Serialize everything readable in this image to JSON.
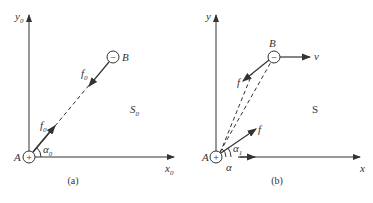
{
  "panels": [
    {
      "id": "a",
      "caption": "(a)",
      "frame_label": "S",
      "frame_sub": "0",
      "x_axis": {
        "label": "x",
        "sub": "0"
      },
      "y_axis": {
        "label": "y",
        "sub": "0"
      },
      "charge_A": {
        "label": "A",
        "sign": "+"
      },
      "charge_B": {
        "label": "B",
        "sign": "−"
      },
      "force_on_A": {
        "label": "f",
        "sub": "0"
      },
      "force_on_B": {
        "label": "f",
        "sub": "0"
      },
      "angle": {
        "label": "α",
        "sub": "0"
      }
    },
    {
      "id": "b",
      "caption": "(b)",
      "frame_label": "S",
      "x_axis": {
        "label": "x"
      },
      "y_axis": {
        "label": "y"
      },
      "charge_A": {
        "label": "A",
        "sign": "+"
      },
      "charge_B": {
        "label": "B",
        "sign": "−"
      },
      "force_on_A": {
        "label": "f"
      },
      "force_on_B": {
        "label": "f"
      },
      "velocity": {
        "label": "v"
      },
      "angle_1": {
        "label": "α",
        "sub": "1"
      },
      "angle": {
        "label": "α"
      }
    }
  ],
  "colors": {
    "ink": "#333333",
    "background": "#ffffff"
  }
}
